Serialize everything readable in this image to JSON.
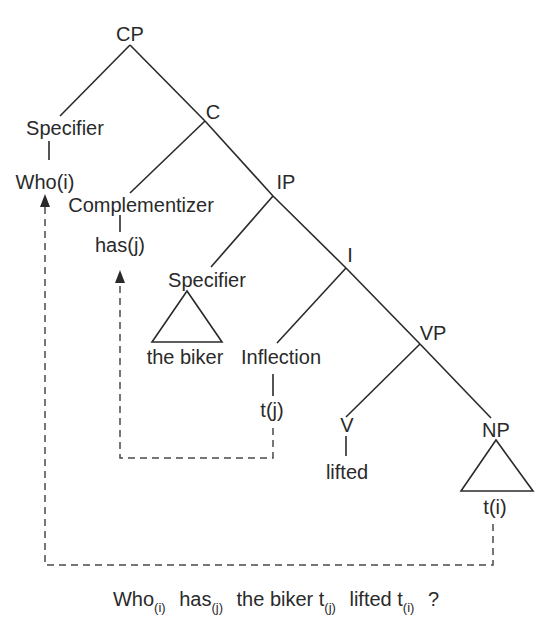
{
  "diagram": {
    "type": "syntax-tree",
    "nodes": {
      "cp": "CP",
      "cp_specifier": "Specifier",
      "who": "Who(i)",
      "c": "C",
      "complementizer": "Complementizer",
      "has": "has(j)",
      "ip": "IP",
      "ip_specifier": "Specifier",
      "the_biker": "the biker",
      "i": "I",
      "inflection": "Inflection",
      "tj": "t(j)",
      "vp": "VP",
      "v": "V",
      "lifted": "lifted",
      "np": "NP",
      "ti": "t(i)"
    },
    "movements": [
      {
        "from": "t(j)",
        "to": "has(j)",
        "style": "dashed-arrow"
      },
      {
        "from": "t(i)",
        "to": "Who(i)",
        "style": "dashed-arrow"
      }
    ],
    "sentence": {
      "words": [
        {
          "text": "Who",
          "sub": "(i)"
        },
        {
          "text": "has",
          "sub": "(j)"
        },
        {
          "text": "the biker t",
          "sub": "(j)"
        },
        {
          "text": "lifted t",
          "sub": "(i)"
        },
        {
          "text": "?",
          "sub": ""
        }
      ]
    },
    "colors": {
      "line": "#2a2a2a",
      "dashed": "#555555",
      "background": "#ffffff"
    }
  }
}
